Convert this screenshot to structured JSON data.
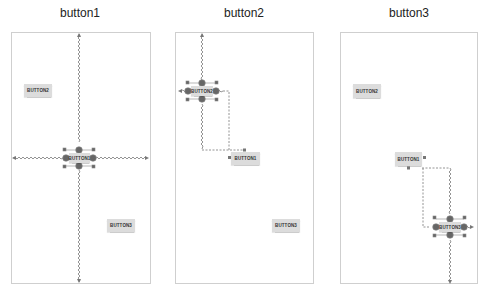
{
  "panels": [
    {
      "title": "button1",
      "selected": "BUTTON1",
      "buttons": {
        "button1": "BUTTON1",
        "button2": "BUTTON2",
        "button3": "BUTTON3"
      }
    },
    {
      "title": "button2",
      "selected": "BUTTON2",
      "buttons": {
        "button1": "BUTTON1",
        "button2": "BUTTON2",
        "button3": "BUTTON3"
      }
    },
    {
      "title": "button3",
      "selected": "BUTTON3",
      "buttons": {
        "button1": "BUTTON1",
        "button2": "BUTTON2",
        "button3": "BUTTON3"
      }
    }
  ],
  "colors": {
    "border": "#cfcfcf",
    "button_bg": "#dcdcdc",
    "handle": "#666666",
    "constraint": "#888888"
  }
}
